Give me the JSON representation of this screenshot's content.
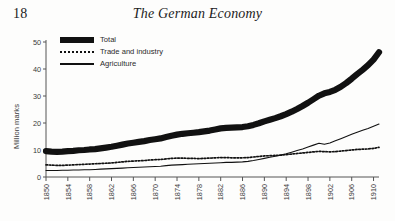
{
  "page": {
    "number": "18",
    "running_head": "The German Economy"
  },
  "chart_data": {
    "type": "line",
    "title": "",
    "xlabel": "",
    "ylabel": "Million marks",
    "xlim": [
      1850,
      1911
    ],
    "ylim": [
      0,
      50
    ],
    "grid": false,
    "legend_position": "top-left",
    "ytick_labels": [
      "0",
      "10",
      "20",
      "30",
      "40",
      "50"
    ],
    "ytick_values": [
      0,
      10,
      20,
      30,
      40,
      50
    ],
    "xtick_labels": [
      "1850",
      "1854",
      "1858",
      "1862",
      "1866",
      "1870",
      "1874",
      "1878",
      "1882",
      "1886",
      "1890",
      "1894",
      "1898",
      "1902",
      "1906",
      "1910"
    ],
    "xtick_values": [
      1850,
      1854,
      1858,
      1862,
      1866,
      1870,
      1874,
      1878,
      1882,
      1886,
      1890,
      1894,
      1898,
      1902,
      1906,
      1910
    ],
    "x": [
      1850,
      1851,
      1852,
      1853,
      1854,
      1855,
      1856,
      1857,
      1858,
      1859,
      1860,
      1861,
      1862,
      1863,
      1864,
      1865,
      1866,
      1867,
      1868,
      1869,
      1870,
      1871,
      1872,
      1873,
      1874,
      1875,
      1876,
      1877,
      1878,
      1879,
      1880,
      1881,
      1882,
      1883,
      1884,
      1885,
      1886,
      1887,
      1888,
      1889,
      1890,
      1891,
      1892,
      1893,
      1894,
      1895,
      1896,
      1897,
      1898,
      1899,
      1900,
      1901,
      1902,
      1903,
      1904,
      1905,
      1906,
      1907,
      1908,
      1909,
      1910,
      1911
    ],
    "series": [
      {
        "name": "Total",
        "style": "thick-band",
        "color": "#111111",
        "values": [
          9.6,
          9.4,
          9.3,
          9.4,
          9.6,
          9.7,
          9.9,
          10.0,
          10.2,
          10.3,
          10.6,
          10.9,
          11.2,
          11.6,
          12.0,
          12.4,
          12.7,
          13.0,
          13.3,
          13.7,
          14.0,
          14.3,
          14.8,
          15.3,
          15.7,
          16.0,
          16.2,
          16.4,
          16.6,
          16.9,
          17.2,
          17.6,
          18.0,
          18.2,
          18.3,
          18.4,
          18.5,
          18.8,
          19.3,
          19.9,
          20.6,
          21.2,
          21.8,
          22.5,
          23.3,
          24.2,
          25.2,
          26.3,
          27.5,
          28.8,
          30.1,
          31.0,
          31.5,
          32.3,
          33.4,
          34.8,
          36.4,
          38.1,
          39.7,
          41.4,
          43.5,
          46.2
        ]
      },
      {
        "name": "Trade and industry",
        "style": "dotted",
        "color": "#111111",
        "values": [
          4.5,
          4.4,
          4.3,
          4.3,
          4.4,
          4.5,
          4.6,
          4.7,
          4.8,
          4.9,
          5.0,
          5.1,
          5.2,
          5.4,
          5.6,
          5.8,
          5.9,
          6.0,
          6.1,
          6.3,
          6.4,
          6.5,
          6.7,
          6.9,
          7.0,
          7.0,
          6.9,
          6.9,
          6.8,
          6.9,
          7.0,
          7.1,
          7.2,
          7.2,
          7.1,
          7.1,
          7.1,
          7.2,
          7.4,
          7.6,
          7.8,
          7.9,
          8.0,
          8.1,
          8.3,
          8.5,
          8.7,
          8.9,
          9.1,
          9.3,
          9.5,
          9.4,
          9.3,
          9.4,
          9.6,
          9.8,
          10.0,
          10.2,
          10.3,
          10.4,
          10.6,
          11.0
        ]
      },
      {
        "name": "Agriculture",
        "style": "solid",
        "color": "#111111",
        "values": [
          2.4,
          2.4,
          2.4,
          2.5,
          2.5,
          2.6,
          2.6,
          2.7,
          2.7,
          2.8,
          2.9,
          3.0,
          3.1,
          3.2,
          3.3,
          3.4,
          3.5,
          3.6,
          3.7,
          3.8,
          3.9,
          4.0,
          4.2,
          4.4,
          4.5,
          4.6,
          4.7,
          4.8,
          4.9,
          5.0,
          5.1,
          5.2,
          5.3,
          5.4,
          5.4,
          5.5,
          5.6,
          5.8,
          6.1,
          6.5,
          6.9,
          7.3,
          7.7,
          8.1,
          8.6,
          9.2,
          9.8,
          10.4,
          11.1,
          11.8,
          12.5,
          12.1,
          12.6,
          13.4,
          14.2,
          15.0,
          15.8,
          16.6,
          17.3,
          18.0,
          18.8,
          19.6
        ]
      }
    ]
  }
}
